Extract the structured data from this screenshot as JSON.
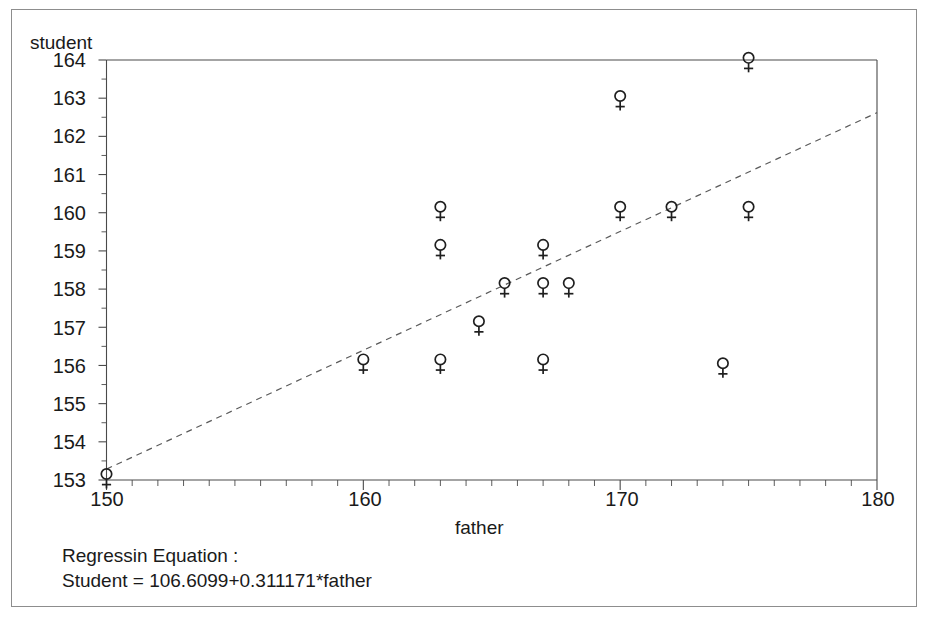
{
  "chart_data": {
    "type": "scatter",
    "title": "",
    "xlabel": "father",
    "ylabel": "student",
    "xlim": [
      150,
      180
    ],
    "xticks": [
      150,
      160,
      170,
      180
    ],
    "ylim": [
      153,
      164
    ],
    "yticks": [
      153,
      154,
      155,
      156,
      157,
      158,
      159,
      160,
      161,
      162,
      163,
      164
    ],
    "grid": false,
    "legend": null,
    "marker": "female-symbol",
    "points": [
      {
        "x": 150.0,
        "y": 153.0
      },
      {
        "x": 160.0,
        "y": 156.0
      },
      {
        "x": 163.0,
        "y": 160.0
      },
      {
        "x": 163.0,
        "y": 159.0
      },
      {
        "x": 163.0,
        "y": 156.0
      },
      {
        "x": 164.5,
        "y": 157.0
      },
      {
        "x": 165.5,
        "y": 158.0
      },
      {
        "x": 167.0,
        "y": 159.0
      },
      {
        "x": 167.0,
        "y": 158.0
      },
      {
        "x": 167.0,
        "y": 156.0
      },
      {
        "x": 168.0,
        "y": 158.0
      },
      {
        "x": 170.0,
        "y": 162.9
      },
      {
        "x": 170.0,
        "y": 160.0
      },
      {
        "x": 172.0,
        "y": 160.0
      },
      {
        "x": 174.0,
        "y": 155.9
      },
      {
        "x": 175.0,
        "y": 163.9
      },
      {
        "x": 175.0,
        "y": 160.0
      }
    ],
    "fit_line": {
      "style": "dashed",
      "intercept": 106.6099,
      "slope": 0.311171,
      "x_start": 150,
      "x_end": 180
    },
    "annotations": {
      "equation_heading": "Regressin Equation :",
      "equation_text": "Student = 106.6099+0.311171*father"
    }
  },
  "axes": {
    "y_title": "student",
    "x_title": "father",
    "y_tick_labels": [
      "164",
      "163",
      "162",
      "161",
      "160",
      "159",
      "158",
      "157",
      "156",
      "155",
      "154",
      "153"
    ],
    "x_tick_labels": [
      "150",
      "160",
      "170",
      "180"
    ]
  },
  "colors": {
    "frame": "#4a4a4a",
    "marker": "#1f1f1f",
    "fit_line": "#5a5a5a",
    "text": "#1a1a1a",
    "background": "#ffffff",
    "outer_border": "#8d8d8d"
  }
}
